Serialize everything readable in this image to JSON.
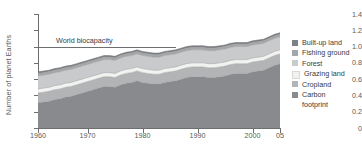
{
  "chart_data": {
    "type": "area",
    "stacked": true,
    "title": "",
    "xlabel": "",
    "ylabel": "Number of planet Earths",
    "xlim": [
      1961,
      2005
    ],
    "ylim": [
      0,
      1.4
    ],
    "grid": false,
    "legend_position": "right",
    "x_tick_labels": [
      "1960",
      "1970",
      "1980",
      "1990",
      "2000",
      "05"
    ],
    "x_tick_values": [
      1960,
      1970,
      1980,
      1990,
      2000,
      2005
    ],
    "y_tick_labels": [
      "0",
      "0.2",
      "0.4",
      "0.6",
      "0.8",
      "1.0",
      "1.2",
      "1.4"
    ],
    "y_tick_values": [
      0,
      0.2,
      0.4,
      0.6,
      0.8,
      1.0,
      1.2,
      1.4
    ],
    "annotations": [
      {
        "label": "World biocapacity",
        "type": "hline",
        "y": 1.0,
        "x_start": 1961,
        "x_end": 1986,
        "color": "#6d6e70"
      }
    ],
    "x": [
      1961,
      1962,
      1963,
      1964,
      1965,
      1966,
      1967,
      1968,
      1969,
      1970,
      1971,
      1972,
      1973,
      1974,
      1975,
      1976,
      1977,
      1978,
      1979,
      1980,
      1981,
      1982,
      1983,
      1984,
      1985,
      1986,
      1987,
      1988,
      1989,
      1990,
      1991,
      1992,
      1993,
      1994,
      1995,
      1996,
      1997,
      1998,
      1999,
      2000,
      2001,
      2002,
      2003,
      2004,
      2005
    ],
    "series": [
      {
        "name": "Carbon footprint",
        "color": "#898a8d",
        "values": [
          0.31,
          0.32,
          0.33,
          0.35,
          0.36,
          0.38,
          0.39,
          0.41,
          0.43,
          0.45,
          0.47,
          0.49,
          0.51,
          0.51,
          0.5,
          0.53,
          0.55,
          0.56,
          0.58,
          0.56,
          0.55,
          0.54,
          0.54,
          0.56,
          0.57,
          0.58,
          0.6,
          0.62,
          0.63,
          0.63,
          0.63,
          0.62,
          0.62,
          0.63,
          0.64,
          0.66,
          0.67,
          0.67,
          0.67,
          0.69,
          0.7,
          0.71,
          0.74,
          0.77,
          0.79
        ]
      },
      {
        "name": "Cropland",
        "color": "#b3b4b6",
        "values": [
          0.12,
          0.12,
          0.12,
          0.12,
          0.12,
          0.12,
          0.12,
          0.12,
          0.12,
          0.12,
          0.12,
          0.12,
          0.12,
          0.12,
          0.12,
          0.12,
          0.12,
          0.12,
          0.12,
          0.12,
          0.12,
          0.12,
          0.12,
          0.12,
          0.12,
          0.12,
          0.12,
          0.12,
          0.12,
          0.12,
          0.12,
          0.12,
          0.12,
          0.12,
          0.12,
          0.12,
          0.12,
          0.12,
          0.12,
          0.12,
          0.12,
          0.12,
          0.12,
          0.12,
          0.12
        ]
      },
      {
        "name": "Grazing land",
        "color": "#f2f2f0",
        "values": [
          0.05,
          0.05,
          0.05,
          0.05,
          0.05,
          0.05,
          0.05,
          0.05,
          0.05,
          0.05,
          0.05,
          0.05,
          0.05,
          0.05,
          0.05,
          0.05,
          0.05,
          0.05,
          0.05,
          0.05,
          0.05,
          0.05,
          0.05,
          0.05,
          0.05,
          0.05,
          0.05,
          0.05,
          0.05,
          0.05,
          0.05,
          0.05,
          0.05,
          0.05,
          0.05,
          0.05,
          0.05,
          0.05,
          0.05,
          0.05,
          0.05,
          0.05,
          0.05,
          0.05,
          0.05
        ]
      },
      {
        "name": "Forest",
        "color": "#c9cacb",
        "values": [
          0.16,
          0.16,
          0.16,
          0.16,
          0.16,
          0.16,
          0.16,
          0.16,
          0.16,
          0.16,
          0.16,
          0.16,
          0.16,
          0.16,
          0.16,
          0.16,
          0.16,
          0.16,
          0.16,
          0.16,
          0.16,
          0.16,
          0.16,
          0.16,
          0.16,
          0.16,
          0.16,
          0.16,
          0.16,
          0.16,
          0.16,
          0.16,
          0.16,
          0.16,
          0.16,
          0.16,
          0.16,
          0.16,
          0.16,
          0.16,
          0.16,
          0.16,
          0.16,
          0.16,
          0.16
        ]
      },
      {
        "name": "Fishing ground",
        "color": "#a5a7a9",
        "values": [
          0.03,
          0.03,
          0.03,
          0.03,
          0.03,
          0.03,
          0.03,
          0.03,
          0.03,
          0.03,
          0.03,
          0.03,
          0.03,
          0.03,
          0.03,
          0.03,
          0.03,
          0.03,
          0.03,
          0.03,
          0.03,
          0.03,
          0.03,
          0.03,
          0.03,
          0.03,
          0.03,
          0.03,
          0.03,
          0.03,
          0.03,
          0.03,
          0.03,
          0.03,
          0.03,
          0.03,
          0.03,
          0.03,
          0.03,
          0.03,
          0.03,
          0.03,
          0.03,
          0.03,
          0.03
        ]
      },
      {
        "name": "Built-up land",
        "color": "#7e8083",
        "values": [
          0.02,
          0.02,
          0.02,
          0.02,
          0.02,
          0.02,
          0.02,
          0.02,
          0.02,
          0.02,
          0.02,
          0.02,
          0.02,
          0.02,
          0.02,
          0.02,
          0.02,
          0.02,
          0.02,
          0.02,
          0.02,
          0.02,
          0.02,
          0.02,
          0.02,
          0.02,
          0.02,
          0.02,
          0.02,
          0.02,
          0.02,
          0.02,
          0.02,
          0.02,
          0.02,
          0.02,
          0.02,
          0.02,
          0.02,
          0.02,
          0.02,
          0.02,
          0.02,
          0.02,
          0.02
        ]
      }
    ],
    "totals": [
      0.69,
      0.7,
      0.71,
      0.73,
      0.74,
      0.76,
      0.77,
      0.79,
      0.81,
      0.83,
      0.85,
      0.87,
      0.89,
      0.89,
      0.88,
      0.91,
      0.93,
      0.94,
      0.96,
      0.94,
      0.93,
      0.92,
      0.92,
      0.94,
      0.95,
      0.96,
      0.98,
      1.0,
      1.01,
      1.01,
      1.01,
      1.0,
      1.0,
      1.01,
      1.02,
      1.04,
      1.05,
      1.05,
      1.05,
      1.07,
      1.08,
      1.09,
      1.12,
      1.15,
      1.17
    ]
  },
  "legend": {
    "items": [
      {
        "label": "Built-up land",
        "color": "#7e8083"
      },
      {
        "label": "Fishing ground",
        "color": "#a5a7a9"
      },
      {
        "label": "Forest",
        "color": "#c9cacb"
      },
      {
        "label": "Grazing land",
        "color": "#f2f2f0"
      },
      {
        "label": "Cropland",
        "color": "#b3b4b6"
      },
      {
        "label": "Carbon",
        "label2": "footprint",
        "color": "#898a8d"
      }
    ]
  }
}
